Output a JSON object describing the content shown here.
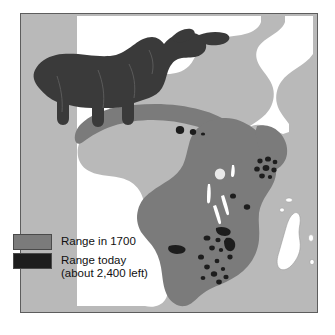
{
  "figure": {
    "kind": "thematic-range-map"
  },
  "map": {
    "continent_label": "Africa",
    "colors": {
      "background": "#b9b9b9",
      "land_outside_range": "#ffffff",
      "range_1700": "#7b7b7b",
      "range_today": "#1d1d1d",
      "border": "#5d5d5d",
      "rhino": "#3a3a3a"
    },
    "regions": [
      {
        "name": "west-african-sahel-band",
        "fill": "range_1700"
      },
      {
        "name": "east-and-southern-africa",
        "fill": "range_1700"
      }
    ],
    "today_spot_clusters": [
      {
        "name": "west-african-spots",
        "count": 3
      },
      {
        "name": "east-african-spots",
        "count": 9
      },
      {
        "name": "southern-african-spots",
        "count": 16
      }
    ],
    "islands": [
      {
        "name": "madagascar",
        "fill": "land_outside_range"
      },
      {
        "name": "comoros",
        "fill": "land_outside_range"
      },
      {
        "name": "mascarene-islands",
        "fill": "land_outside_range"
      },
      {
        "name": "socotra",
        "fill": "land_outside_range"
      }
    ],
    "illustration": {
      "name": "rhinoceros-silhouette",
      "description": "Black rhinoceros facing right with two horns"
    }
  },
  "legend": {
    "items": [
      {
        "id": "range-1700",
        "swatch_color": "#7b7b7b",
        "line1": "Range in 1700",
        "line2": ""
      },
      {
        "id": "range-today",
        "swatch_color": "#1d1d1d",
        "line1": "Range today",
        "line2": "(about 2,400 left)"
      }
    ]
  }
}
